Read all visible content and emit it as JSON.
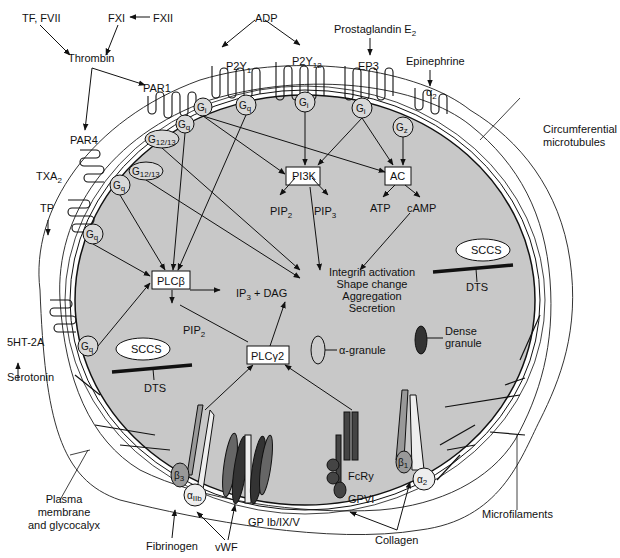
{
  "diagram": {
    "type": "platelet signaling pathways",
    "agonists": {
      "tf_fvii": "TF, FVII",
      "fxi": "FXI",
      "fxii": "FXII",
      "thrombin": "Thrombin",
      "adp": "ADP",
      "prostaglandin": "Prostaglandin E",
      "prostaglandin_sub": "2",
      "epinephrine": "Epinephrine",
      "txa": "TXA",
      "txa_sub": "2",
      "serotonin": "Serotonin",
      "fibrinogen": "Fibrinogen",
      "vwf": "vWF",
      "collagen": "Collagen"
    },
    "receptors": {
      "par1": "PAR1",
      "par4": "PAR4",
      "p2y1": "P2Y",
      "p2y1_sub": "1",
      "p2y12": "P2Y",
      "p2y12_sub": "12",
      "ep3": "EP3",
      "alpha2": "α",
      "alpha2_sub": "2",
      "tp": "TP",
      "ht2a": "5HT-2A",
      "gp_ib": "GP Ib/IX/V",
      "fcry": "FcRy",
      "gpvi": "GPVI",
      "beta3": "β",
      "beta3_sub": "3",
      "alpha_iib": "α",
      "alpha_iib_sub": "IIb",
      "beta1": "β",
      "beta1_sub": "1",
      "alpha2_int": "α",
      "alpha2_int_sub": "2"
    },
    "g_proteins": {
      "g": "G",
      "q": "q",
      "i": "i",
      "z": "z",
      "g1213": "12/13"
    },
    "enzymes": {
      "pi3k": "PI3K",
      "ac": "AC",
      "plcb": "PLCβ",
      "plcg2": "PLCγ2"
    },
    "messengers": {
      "pip2_a": "PIP",
      "pip2_a_sub": "2",
      "pip3": "PIP",
      "pip3_sub": "3",
      "atp": "ATP",
      "camp": "cAMP",
      "ip3": "IP",
      "ip3_sub": "3",
      "dag": " + DAG",
      "pip2_b": "PIP",
      "pip2_b_sub": "2"
    },
    "outcomes": [
      "Integrin activation",
      "Shape change",
      "Aggregation",
      "Secretion"
    ],
    "structures": {
      "sccs": "SCCS",
      "dts": "DTS",
      "alpha_granule": "α-granule",
      "dense_granule_1": "Dense",
      "dense_granule_2": "granule",
      "circ_micro_1": "Circumferential",
      "circ_micro_2": "microtubules",
      "plasma_1": "Plasma",
      "plasma_2": "membrane",
      "plasma_3": "and glycocalyx",
      "microfilaments": "Microfilaments"
    },
    "colors": {
      "cytoplasm": "#c8c8c8",
      "line": "#111111",
      "dark_receptor": "#3a3a3a",
      "mid_receptor": "#8a8a8a",
      "granule_dense": "#333333"
    }
  }
}
